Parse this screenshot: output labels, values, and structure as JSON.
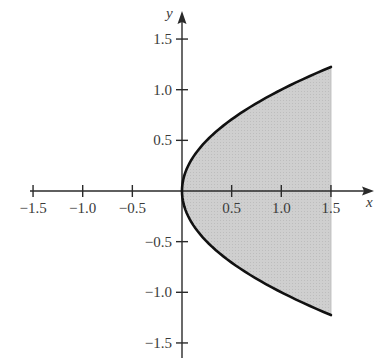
{
  "chart_data": {
    "type": "area",
    "title": "",
    "curve": {
      "equation": "x = y^2",
      "y_range": [
        -1.2247,
        1.2247
      ],
      "points": [
        {
          "x": 1.5,
          "y": 1.2247
        },
        {
          "x": 1.0,
          "y": 1.0
        },
        {
          "x": 0.5,
          "y": 0.7071
        },
        {
          "x": 0.25,
          "y": 0.5
        },
        {
          "x": 0.0625,
          "y": 0.25
        },
        {
          "x": 0.0,
          "y": 0.0
        },
        {
          "x": 0.0625,
          "y": -0.25
        },
        {
          "x": 0.25,
          "y": -0.5
        },
        {
          "x": 0.5,
          "y": -0.7071
        },
        {
          "x": 1.0,
          "y": -1.0
        },
        {
          "x": 1.5,
          "y": -1.2247
        }
      ]
    },
    "shaded_region": {
      "left_boundary": "x = y^2",
      "right_boundary": "x = 1.5",
      "fill_color": "#d0d0d0"
    },
    "xlabel": "x",
    "ylabel": "y",
    "xlim": [
      -1.5,
      1.5
    ],
    "ylim": [
      -1.5,
      1.5
    ],
    "x_ticks": [
      -1.5,
      -1.0,
      -0.5,
      0.5,
      1.0,
      1.5
    ],
    "y_ticks": [
      1.5,
      1.0,
      0.5,
      -0.5,
      -1.0,
      -1.5
    ],
    "x_tick_labels": [
      "−1.5",
      "−1.0",
      "−0.5",
      "0.5",
      "1.0",
      "1.5"
    ],
    "y_tick_labels": [
      "1.5",
      "1.0",
      "0.5",
      "−0.5",
      "−1.0",
      "−1.5"
    ],
    "grid": false,
    "legend": null
  },
  "colors": {
    "axis": "#2a2a2a",
    "curve": "#111111",
    "fill": "#d0d0d0",
    "background": "#ffffff"
  }
}
